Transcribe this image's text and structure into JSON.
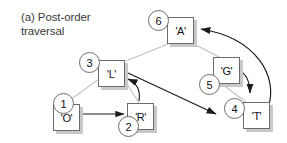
{
  "figure": {
    "caption": "(a) Post-order\ntraversal",
    "colors": {
      "tree_edge": "#c2c2c2",
      "traversal_arrow": "#1a1a1a",
      "node_border": "#6b6b6b",
      "node_fill": "#ffffff",
      "shadow": "#c9c9c9",
      "text": "#111111",
      "caption_text": "#3a3a3a"
    }
  },
  "nodes": [
    {
      "id": "A",
      "label": "'A'",
      "order": "6",
      "x": 167,
      "y": 17,
      "circle_x": 148,
      "circle_y": 10
    },
    {
      "id": "L",
      "label": "'L'",
      "order": "3",
      "x": 98,
      "y": 60,
      "circle_x": 79,
      "circle_y": 52
    },
    {
      "id": "O",
      "label": "'O'",
      "order": "1",
      "x": 53,
      "y": 104,
      "circle_x": 53,
      "circle_y": 93
    },
    {
      "id": "R",
      "label": "'R'",
      "order": "2",
      "x": 127,
      "y": 103,
      "circle_x": 118,
      "circle_y": 116
    },
    {
      "id": "G",
      "label": "'G'",
      "order": "5",
      "x": 213,
      "y": 57,
      "circle_x": 199,
      "circle_y": 74
    },
    {
      "id": "T",
      "label": "'T'",
      "order": "4",
      "x": 243,
      "y": 102,
      "circle_x": 224,
      "circle_y": 98
    }
  ],
  "tree_edges": [
    {
      "from": "A",
      "to": "L"
    },
    {
      "from": "A",
      "to": "G"
    },
    {
      "from": "L",
      "to": "O"
    },
    {
      "from": "L",
      "to": "R"
    },
    {
      "from": "G",
      "to": "T"
    }
  ],
  "traversal_arrows": [
    {
      "from": "O",
      "to": "R",
      "step": "1-2",
      "shape": "straight"
    },
    {
      "from": "R",
      "to": "L",
      "step": "2-3",
      "shape": "curved"
    },
    {
      "from": "L",
      "to": "T",
      "step": "3-4",
      "shape": "straight"
    },
    {
      "from": "G",
      "to": "T",
      "step": "5-4",
      "shape": "curved"
    },
    {
      "from": "T",
      "to": "A",
      "step": "4-6",
      "shape": "curved"
    }
  ]
}
